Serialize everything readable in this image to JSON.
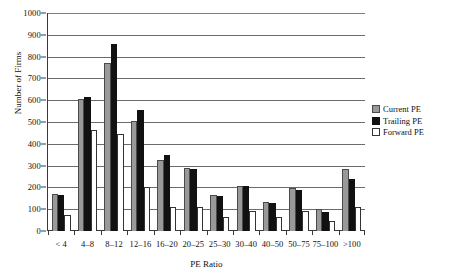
{
  "chart_data": {
    "type": "bar",
    "title": "",
    "xlabel": "PE Ratio",
    "ylabel": "Number of Firms",
    "ylim": [
      0,
      1000
    ],
    "ytick_step": 100,
    "yticks": [
      "1000",
      "900",
      "800",
      "700",
      "600",
      "500",
      "400",
      "300",
      "200",
      "100",
      "0"
    ],
    "grid": true,
    "legend_position": "right",
    "categories": [
      "< 4",
      "4–8",
      "8–12",
      "12–16",
      "16–20",
      "20–25",
      "25–30",
      "30–40",
      "40–50",
      "50–75",
      "75–100",
      ">100"
    ],
    "series": [
      {
        "name": "Current PE",
        "color": "#999999",
        "values": [
          170,
          605,
          770,
          505,
          325,
          287,
          163,
          208,
          133,
          197,
          100,
          283
        ]
      },
      {
        "name": "Trailing PE",
        "color": "#111111",
        "values": [
          167,
          617,
          860,
          555,
          350,
          285,
          160,
          205,
          128,
          190,
          87,
          240
        ]
      },
      {
        "name": "Forward PE",
        "color": "#ffffff",
        "values": [
          75,
          462,
          443,
          200,
          112,
          110,
          62,
          92,
          65,
          93,
          45,
          112
        ]
      }
    ]
  },
  "legend": {
    "items": [
      {
        "label": "Current PE",
        "swatch": "current"
      },
      {
        "label": "Trailing PE",
        "swatch": "trailing"
      },
      {
        "label": "Forward PE",
        "swatch": "forward"
      }
    ]
  },
  "axes": {
    "y_title": "Number of Firms",
    "x_title": "PE Ratio"
  },
  "colors": {
    "current": "#999999",
    "trailing": "#111111",
    "forward": "#ffffff",
    "axis": "#3a3a3a",
    "grid": "#6b6b6b"
  }
}
